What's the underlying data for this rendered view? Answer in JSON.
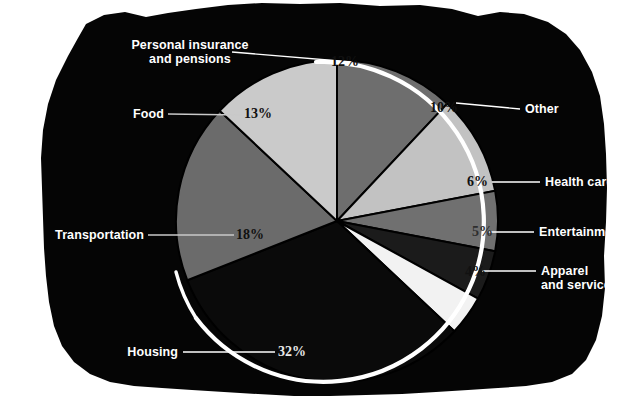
{
  "figure": {
    "kind": "pie-chart-infographic",
    "background_color": "#ffffff",
    "panel_color": "#050505",
    "panel_style": "torn-paper-irregular-black-panel",
    "outline_arc_color": "#ffffff"
  },
  "chart_data": {
    "type": "pie",
    "title": "",
    "subtitle": "",
    "xlabel": "",
    "ylabel": "",
    "grid": false,
    "legend_position": "callout-labels-around-pie",
    "value_unit": "percent",
    "value_suffix": "%",
    "total": 100,
    "start_angle_deg": -90,
    "direction": "clockwise",
    "categories": [
      "Personal insurance and pensions",
      "Other",
      "Health care",
      "Entertainment",
      "Apparel and services",
      "Housing",
      "Transportation",
      "Food"
    ],
    "values": [
      12,
      10,
      6,
      5,
      4,
      32,
      18,
      13
    ],
    "slices": [
      {
        "label": "Personal insurance and pensions",
        "label_line1": "Personal insurance",
        "label_line2": "and pensions",
        "value": 12,
        "value_text": "12%",
        "color": "#6e6e6e",
        "value_text_color": "#111111"
      },
      {
        "label": "Other",
        "label_line1": "Other",
        "label_line2": "",
        "value": 10,
        "value_text": "10%",
        "color": "#c2c2c2",
        "value_text_color": "#111111"
      },
      {
        "label": "Health care",
        "label_line1": "Health care",
        "label_line2": "",
        "value": 6,
        "value_text": "6%",
        "color": "#707070",
        "value_text_color": "#111111"
      },
      {
        "label": "Entertainment",
        "label_line1": "Entertainment",
        "label_line2": "",
        "value": 5,
        "value_text": "5%",
        "color": "#1b1b1b",
        "value_text_color": "#2e2e2e"
      },
      {
        "label": "Apparel and services",
        "label_line1": "Apparel",
        "label_line2": "and services",
        "value": 4,
        "value_text": "4%",
        "color": "#f2f2f2",
        "value_text_color": "#111111"
      },
      {
        "label": "Housing",
        "label_line1": "Housing",
        "label_line2": "",
        "value": 32,
        "value_text": "32%",
        "color": "#0a0a0a",
        "value_text_color": "#e8e8e8"
      },
      {
        "label": "Transportation",
        "label_line1": "Transportation",
        "label_line2": "",
        "value": 18,
        "value_text": "18%",
        "color": "#6b6b6b",
        "value_text_color": "#111111"
      },
      {
        "label": "Food",
        "label_line1": "Food",
        "label_line2": "",
        "value": 13,
        "value_text": "13%",
        "color": "#cacaca",
        "value_text_color": "#111111"
      }
    ]
  }
}
